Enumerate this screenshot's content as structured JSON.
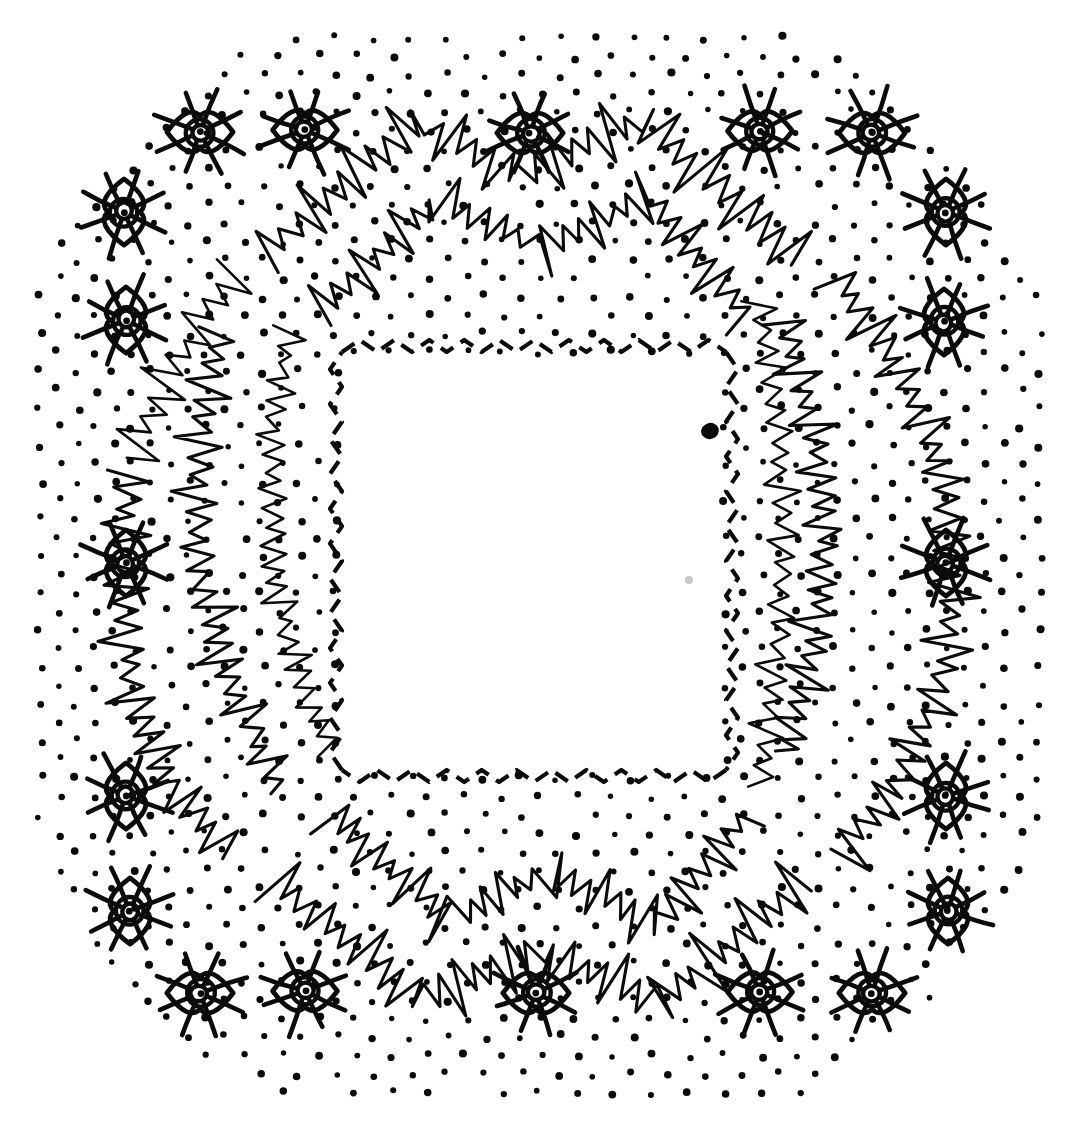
{
  "artwork": {
    "title": "Radiating Eye Motifs with Zigzag Bands and Dot Field",
    "medium": "pen-and-ink line drawing",
    "palette": {
      "background": "#ffffff",
      "ink": "#0b0b0b",
      "dot": "#0a0a0a",
      "smudge": "#9a9a9a"
    },
    "canvas": {
      "width": 1072,
      "height": 1130
    }
  },
  "elements": {
    "dot_field": {
      "label": "stippled dot field",
      "pattern": "staggered-grid",
      "col_spacing": 37,
      "row_spacing": 18.5,
      "radius": 3.4,
      "excluded_region": "central blank square"
    },
    "eye_symbols": {
      "label": "radiating eye symbol",
      "count": 20,
      "parts": [
        "radiating-rays",
        "almond-lid",
        "iris-ring",
        "pupil-dot"
      ],
      "ray_count": 8,
      "placement": "perimeter ring, 5 per side",
      "top_row": [
        {
          "x": 200,
          "y": 132,
          "r": 46,
          "rot": 0
        },
        {
          "x": 305,
          "y": 130,
          "r": 45,
          "rot": 0
        },
        {
          "x": 530,
          "y": 133,
          "r": 46,
          "rot": 0
        },
        {
          "x": 760,
          "y": 131,
          "r": 45,
          "rot": 0
        },
        {
          "x": 872,
          "y": 133,
          "r": 46,
          "rot": 0
        }
      ],
      "bottom_row": [
        {
          "x": 200,
          "y": 993,
          "r": 46,
          "rot": 0
        },
        {
          "x": 305,
          "y": 991,
          "r": 45,
          "rot": 0
        },
        {
          "x": 536,
          "y": 993,
          "r": 46,
          "rot": 0
        },
        {
          "x": 760,
          "y": 992,
          "r": 45,
          "rot": 0
        },
        {
          "x": 872,
          "y": 993,
          "r": 46,
          "rot": 0
        }
      ],
      "left_col": [
        {
          "x": 124,
          "y": 212,
          "r": 46,
          "rot": 90
        },
        {
          "x": 126,
          "y": 320,
          "r": 46,
          "rot": 90
        },
        {
          "x": 126,
          "y": 563,
          "r": 46,
          "rot": 90
        },
        {
          "x": 126,
          "y": 796,
          "r": 46,
          "rot": 90
        },
        {
          "x": 130,
          "y": 911,
          "r": 46,
          "rot": 90
        }
      ],
      "right_col": [
        {
          "x": 946,
          "y": 212,
          "r": 46,
          "rot": 90
        },
        {
          "x": 944,
          "y": 322,
          "r": 46,
          "rot": 90
        },
        {
          "x": 946,
          "y": 563,
          "r": 46,
          "rot": 90
        },
        {
          "x": 946,
          "y": 796,
          "r": 46,
          "rot": 90
        },
        {
          "x": 948,
          "y": 911,
          "r": 46,
          "rot": 90
        }
      ]
    },
    "inner_dashed_border": {
      "label": "dashed chevron border around blank center",
      "shape": "square",
      "bounds": {
        "left": 342,
        "top": 352,
        "right": 726,
        "bottom": 770
      },
      "stroke_style": "dashed",
      "zigzag_amplitude": 12,
      "zigzag_period": 34
    },
    "zigzag_bands": {
      "label": "hand-drawn sawtooth zigzag bands",
      "count": 8,
      "description": "Two concentric rings of sawtooth chevron bands; each side of the composition carries an inner and an outer band forming a broken octagonal frame.",
      "amplitude_major": 26,
      "amplitude_minor": 11,
      "teeth_per_band": 28
    },
    "ink_blob": {
      "label": "solid ink blob",
      "x": 710,
      "y": 431,
      "rx": 9,
      "ry": 8
    },
    "paper_smudge": {
      "label": "faint grey paper smudge",
      "x": 689,
      "y": 580,
      "r": 4
    },
    "blank_center": {
      "label": "blank reserved center field",
      "bounds": {
        "left": 352,
        "top": 362,
        "right": 716,
        "bottom": 760
      }
    }
  }
}
